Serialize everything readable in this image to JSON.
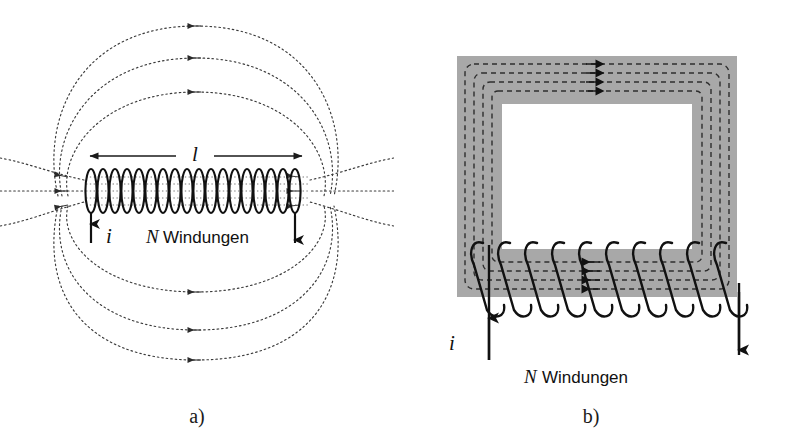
{
  "figure": {
    "background_color": "#ffffff",
    "ink_color": "#1a1a1a",
    "core_fill_color": "#a8a8a8",
    "fieldline_color": "#3a3a3a"
  },
  "panels": [
    {
      "id": "a",
      "caption": "a)",
      "device": "solenoid",
      "labels": {
        "length": "l",
        "current": "i",
        "turns_symbol": "N",
        "turns_word": "Windungen"
      },
      "geometry": {
        "coil_turns": 18,
        "field_loops_top": 3,
        "field_loops_bottom": 3,
        "straight_field_lines_left": 3,
        "straight_field_lines_right": 3,
        "field_line_style": "dotted",
        "field_arrow_direction": "left"
      }
    },
    {
      "id": "b",
      "caption": "b)",
      "device": "toroid",
      "labels": {
        "current": "i",
        "turns_symbol": "N",
        "turns_word": "Windungen"
      },
      "geometry": {
        "coil_turns": 10,
        "field_loops": 4,
        "field_line_style": "dashed",
        "field_arrow_direction_top": "right",
        "field_arrow_direction_bottom": "left",
        "core_shape": "rectangular-ring"
      }
    }
  ]
}
